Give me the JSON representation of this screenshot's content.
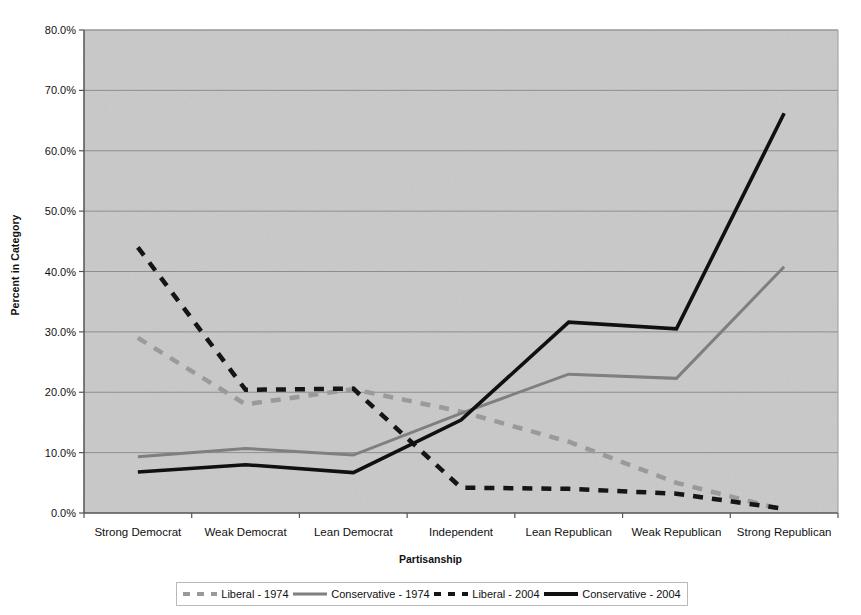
{
  "chart_data": {
    "type": "line",
    "title": "",
    "xlabel": "Partisanship",
    "ylabel": "Percent in Category",
    "categories": [
      "Strong Democrat",
      "Weak Democrat",
      "Lean Democrat",
      "Independent",
      "Lean Republican",
      "Weak Republican",
      "Strong Republican"
    ],
    "ylim": [
      0,
      80
    ],
    "ytick_labels": [
      "0.0%",
      "10.0%",
      "20.0%",
      "30.0%",
      "40.0%",
      "50.0%",
      "60.0%",
      "70.0%",
      "80.0%"
    ],
    "ytick_values": [
      0,
      10,
      20,
      30,
      40,
      50,
      60,
      70,
      80
    ],
    "grid": true,
    "legend_position": "bottom",
    "plot_background": "#c9c9c9",
    "series": [
      {
        "name": "Liberal - 1974",
        "style": "dashed",
        "color": "#9a9a9a",
        "values": [
          29.0,
          18.0,
          20.5,
          16.8,
          11.8,
          5.0,
          0.5
        ]
      },
      {
        "name": "Conservative - 1974",
        "style": "solid",
        "color": "#7f7f7f",
        "values": [
          9.3,
          10.7,
          9.6,
          16.5,
          23.0,
          22.3,
          40.8
        ]
      },
      {
        "name": "Liberal - 2004",
        "style": "dashed",
        "color": "#151515",
        "values": [
          44.0,
          20.4,
          20.6,
          4.2,
          4.0,
          3.2,
          0.7
        ]
      },
      {
        "name": "Conservative - 2004",
        "style": "solid",
        "color": "#101010",
        "values": [
          6.8,
          8.0,
          6.7,
          15.4,
          31.6,
          30.5,
          66.2
        ]
      }
    ]
  },
  "legend": {
    "items": [
      {
        "label": "Liberal - 1974",
        "swatch": "dash-gray"
      },
      {
        "label": "Conservative - 1974",
        "swatch": "solid-gray"
      },
      {
        "label": "Liberal - 2004",
        "swatch": "dash-black"
      },
      {
        "label": "Conservative - 2004",
        "swatch": "solid-black"
      }
    ]
  }
}
